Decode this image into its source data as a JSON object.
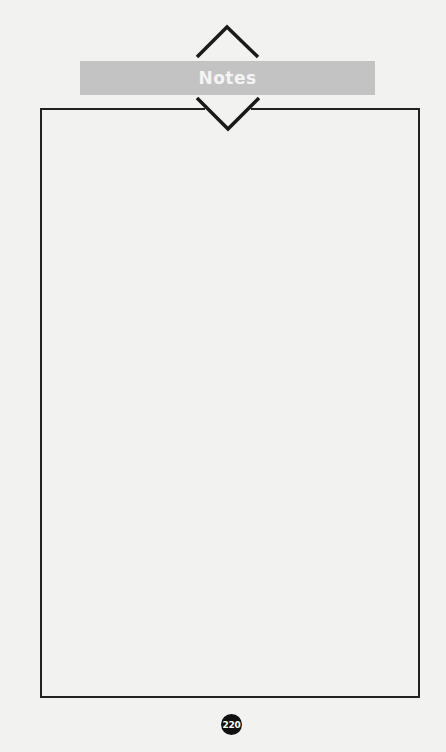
{
  "header": {
    "title": "Notes",
    "banner_color": "#c3c3c3",
    "title_color": "#f4f4f4",
    "icons": [
      "chevron-up-icon",
      "chevron-down-icon"
    ]
  },
  "notes_area": {
    "content": "",
    "border_color": "#222222"
  },
  "footer": {
    "page_number": "220",
    "badge_color": "#111111"
  }
}
